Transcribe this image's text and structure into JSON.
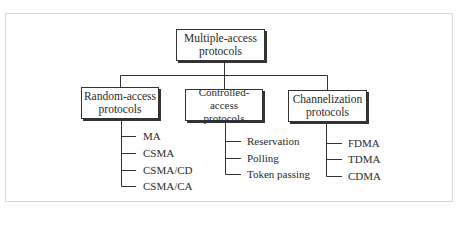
{
  "diagram": {
    "root": {
      "line1": "Multiple-access",
      "line2": "protocols"
    },
    "categories": [
      {
        "line1": "Random-access",
        "line2": "protocols",
        "items": [
          "MA",
          "CSMA",
          "CSMA/CD",
          "CSMA/CA"
        ]
      },
      {
        "line1": "Controlled-access",
        "line2": "protocols",
        "items": [
          "Reservation",
          "Polling",
          "Token passing"
        ]
      },
      {
        "line1": "Channelization",
        "line2": "protocols",
        "items": [
          "FDMA",
          "TDMA",
          "CDMA"
        ]
      }
    ]
  }
}
